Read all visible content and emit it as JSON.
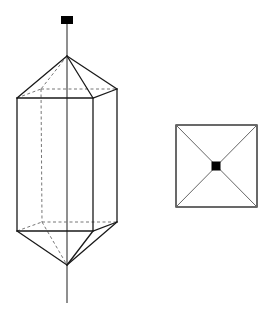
{
  "diagram": {
    "title": "",
    "colors": {
      "line": "#1a1a1a",
      "hidden_line": "#777777",
      "marker": "#000000",
      "background": "#ffffff"
    },
    "side_view": {
      "description": "Hexagonal prism capped by pyramids top and bottom, with vertical axis and black marker on top",
      "marker": {
        "x": 61,
        "y": 16,
        "w": 12,
        "h": 8
      },
      "axis": {
        "x": 67,
        "y1": 24,
        "y2": 303
      },
      "top_apex": [
        67,
        56
      ],
      "bottom_apex": [
        67,
        265
      ],
      "top_ring_front": [
        [
          17,
          98
        ],
        [
          93,
          98
        ],
        [
          117,
          89
        ]
      ],
      "top_ring_back": [
        [
          17,
          98
        ],
        [
          41,
          89
        ],
        [
          117,
          89
        ]
      ],
      "bottom_ring_front": [
        [
          17,
          231
        ],
        [
          93,
          231
        ],
        [
          117,
          222
        ]
      ],
      "bottom_ring_back": [
        [
          17,
          231
        ],
        [
          42,
          222
        ],
        [
          117,
          222
        ]
      ]
    },
    "top_view": {
      "description": "Square outline with diagonals and central black marker",
      "square": {
        "x": 176,
        "y": 125,
        "w": 81,
        "h": 82
      },
      "center": [
        216,
        166
      ],
      "marker_size": 9
    }
  }
}
